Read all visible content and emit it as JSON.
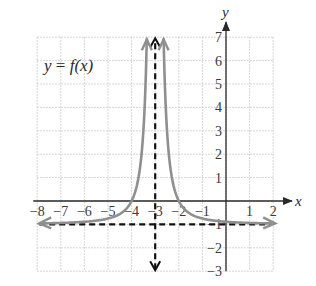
{
  "chart_data": {
    "type": "line",
    "title": "",
    "function_label": "y = f(x)",
    "function_label_parts": {
      "y": "y",
      "eq": " = ",
      "f": "f",
      "rest": "(x)"
    },
    "formula_estimate": "f(x) = 1/(x+3)^2 - 1",
    "xlabel": "x",
    "ylabel": "y",
    "xlim": [
      -8,
      2
    ],
    "ylim": [
      -3,
      7
    ],
    "grid": true,
    "x_ticks": [
      "-8",
      "-7",
      "-6",
      "-5",
      "-4",
      "-3",
      "-2",
      "-1",
      "1",
      "2"
    ],
    "y_ticks": [
      "7",
      "6",
      "5",
      "4",
      "3",
      "2",
      "1",
      "-1",
      "-2",
      "-3"
    ],
    "asymptotes": {
      "vertical": {
        "x": -3,
        "style": "dashed"
      },
      "horizontal": {
        "y": -1,
        "style": "dashed"
      }
    },
    "series": [
      {
        "name": "f(x)",
        "color": "#8f8f8f",
        "points": [
          [
            -8,
            -0.96
          ],
          [
            -7,
            -0.94
          ],
          [
            -6,
            -0.89
          ],
          [
            -5,
            -0.75
          ],
          [
            -4.5,
            -0.56
          ],
          [
            -4,
            0
          ],
          [
            -3.6,
            1.78
          ],
          [
            -3.4,
            5.25
          ],
          [
            -3.35,
            7
          ],
          [
            -2.65,
            7
          ],
          [
            -2.6,
            5.25
          ],
          [
            -2.4,
            1.78
          ],
          [
            -2,
            0
          ],
          [
            -1.5,
            -0.56
          ],
          [
            -1,
            -0.75
          ],
          [
            0,
            -0.89
          ],
          [
            1,
            -0.94
          ],
          [
            2,
            -0.96
          ]
        ]
      }
    ],
    "colors": {
      "curve": "#8f8f8f",
      "axes": "#2a2a2a",
      "asymptote": "#111111",
      "grid": "#c8c8c8"
    }
  }
}
